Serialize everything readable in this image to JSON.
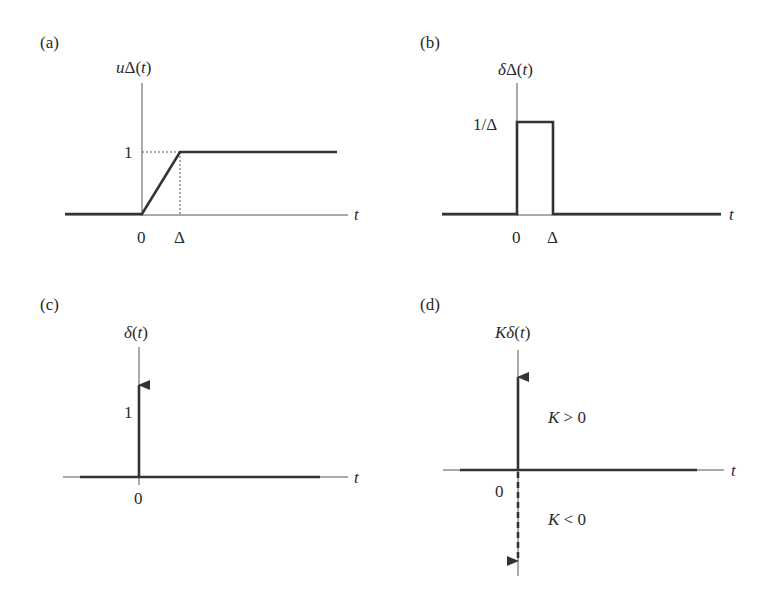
{
  "figure": {
    "panels": [
      {
        "id": "a",
        "tag": "(a)",
        "ylabel_prefix": "u",
        "ylabel_rest": "Δ(",
        "ylabel_var": "t",
        "ylabel_close": ")",
        "xlabel": "t",
        "ytick": "1",
        "xticks": [
          "0",
          "Δ"
        ],
        "description": "Unit ramp-step: 0 for t<0, rises linearly from 0 to 1 over [0, Δ], stays at 1"
      },
      {
        "id": "b",
        "tag": "(b)",
        "ylabel_prefix": "δ",
        "ylabel_rest": "Δ(",
        "ylabel_var": "t",
        "ylabel_close": ")",
        "xlabel": "t",
        "ytick": "1/Δ",
        "xticks": [
          "0",
          "Δ"
        ],
        "description": "Rectangular pulse of height 1/Δ on [0, Δ]"
      },
      {
        "id": "c",
        "tag": "(c)",
        "ylabel_prefix": "δ",
        "ylabel_rest": "(",
        "ylabel_var": "t",
        "ylabel_close": ")",
        "xlabel": "t",
        "ytick": "1",
        "xticks": [
          "0"
        ],
        "description": "Unit impulse at t=0 drawn as upward arrow of area 1"
      },
      {
        "id": "d",
        "tag": "(d)",
        "ylabel_prefix": "Kδ",
        "ylabel_rest": "(",
        "ylabel_var": "t",
        "ylabel_close": ")",
        "xlabel": "t",
        "xticks": [
          "0"
        ],
        "annotation_pos_var": "K",
        "annotation_pos_rest": " > 0",
        "annotation_neg_var": "K",
        "annotation_neg_rest": " < 0",
        "description": "Scaled impulse: upward solid arrow for K>0, downward dashed arrow for K<0"
      }
    ]
  }
}
